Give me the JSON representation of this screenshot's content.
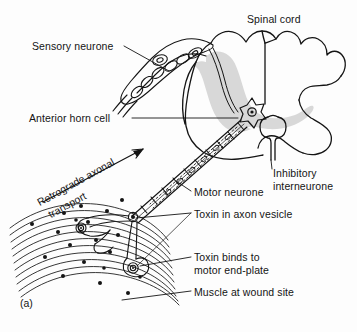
{
  "figure": {
    "caption": "(a)",
    "background_color": "#fdfdfd",
    "ink_color": "#141414",
    "grey_matter_color": "#d8d8d8"
  },
  "labels": {
    "spinal_cord": "Spinal cord",
    "sensory_neurone": "Sensory neurone",
    "anterior_horn_cell": "Anterior horn cell",
    "inhibitory_interneurone_line1": "Inhibitory",
    "inhibitory_interneurone_line2": "interneurone",
    "motor_neurone": "Motor neurone",
    "toxin_in_axon_vesicle": "Toxin in axon vesicle",
    "toxin_binds_line1": "Toxin binds to",
    "toxin_binds_line2": "motor end-plate",
    "muscle_at_wound_site": "Muscle at wound site",
    "retrograde_line1": "Retrograde axonal",
    "retrograde_line2": "transport"
  },
  "structures": [
    {
      "name": "spinal-cord-outline",
      "description": "Cross-section of spinal cord with lobed white matter border"
    },
    {
      "name": "grey-matter",
      "description": "Shaded butterfly-shaped grey matter of spinal cord"
    },
    {
      "name": "dorsal-root-ganglion",
      "description": "Ganglion containing sensory neurone cell bodies"
    },
    {
      "name": "anterior-horn-cell-body",
      "description": "Star-shaped motor neuron cell body with nucleus"
    },
    {
      "name": "inhibitory-interneurone",
      "description": "Loop-shaped interneurone in ventral region"
    },
    {
      "name": "motor-axon",
      "description": "Myelinated motor axon running to muscle"
    },
    {
      "name": "toxin-vesicle-chain",
      "description": "Dashed vesicles travelling retrogradely inside axon"
    },
    {
      "name": "muscle-fibres",
      "description": "Curved parallel muscle fibres at wound site"
    },
    {
      "name": "motor-end-plate",
      "description": "Concentric-ring motor end-plate on muscle fibre"
    },
    {
      "name": "toxin-particles",
      "description": "Scattered black dots representing free toxin"
    }
  ]
}
